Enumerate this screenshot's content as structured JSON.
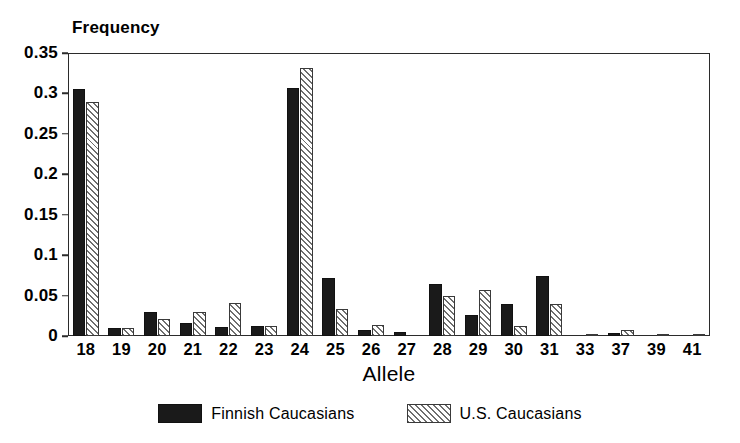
{
  "chart_data": {
    "type": "bar",
    "title": "",
    "subtitle": "",
    "xlabel": "Allele",
    "ylabel": "Frequency",
    "ylim": [
      0,
      0.35
    ],
    "yticks": [
      "0",
      "0.05",
      "0.1",
      "0.15",
      "0.2",
      "0.25",
      "0.3",
      "0.35"
    ],
    "ytick_values": [
      0,
      0.05,
      0.1,
      0.15,
      0.2,
      0.25,
      0.3,
      0.35
    ],
    "grid": false,
    "legend_position": "bottom-center",
    "categories": [
      "18",
      "19",
      "20",
      "21",
      "22",
      "23",
      "24",
      "25",
      "26",
      "27",
      "28",
      "29",
      "30",
      "31",
      "33",
      "37",
      "39",
      "41"
    ],
    "series": [
      {
        "name": "Finnish Caucasians",
        "fill": "solid-black",
        "color": "#1a1a1a",
        "values": [
          0.305,
          0.01,
          0.03,
          0.016,
          0.011,
          0.012,
          0.307,
          0.072,
          0.008,
          0.005,
          0.064,
          0.026,
          0.039,
          0.074,
          0.0,
          0.004,
          0.0,
          0.0
        ]
      },
      {
        "name": "U.S. Caucasians",
        "fill": "diagonal-hatch",
        "color": "#e2e2e2",
        "values": [
          0.29,
          0.01,
          0.021,
          0.03,
          0.041,
          0.013,
          0.331,
          0.033,
          0.014,
          0.0,
          0.05,
          0.057,
          0.012,
          0.039,
          0.003,
          0.008,
          0.003,
          0.003
        ]
      }
    ]
  },
  "legend": {
    "items": [
      {
        "label": "Finnish Caucasians"
      },
      {
        "label": "U.S. Caucasians"
      }
    ]
  }
}
